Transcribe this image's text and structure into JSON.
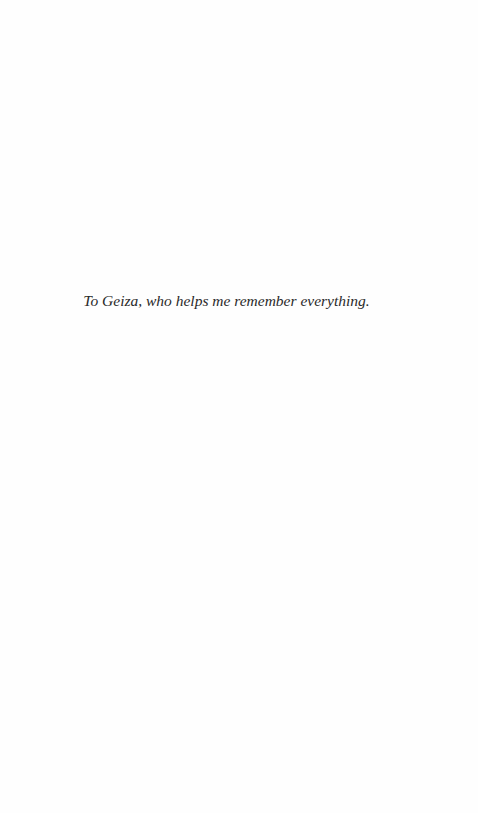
{
  "page": {
    "type": "dedication",
    "text": "To Geiza, who helps me remember everything.",
    "background_color": "#fefefe",
    "text_color": "#2a2a2a"
  }
}
